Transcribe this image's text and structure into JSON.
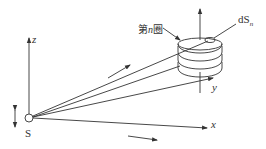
{
  "diagram": {
    "title": "",
    "labels": {
      "source": "S",
      "axis_x": "x",
      "axis_y": "y",
      "axis_z": "z",
      "coil_turn": "第n圈",
      "coil_turn_prefix": "第",
      "coil_turn_var": "n",
      "coil_turn_suffix": "圈",
      "area_element": "dS",
      "area_element_sub": "n"
    },
    "colors": {
      "stroke": "#333333",
      "background": "#ffffff"
    }
  }
}
